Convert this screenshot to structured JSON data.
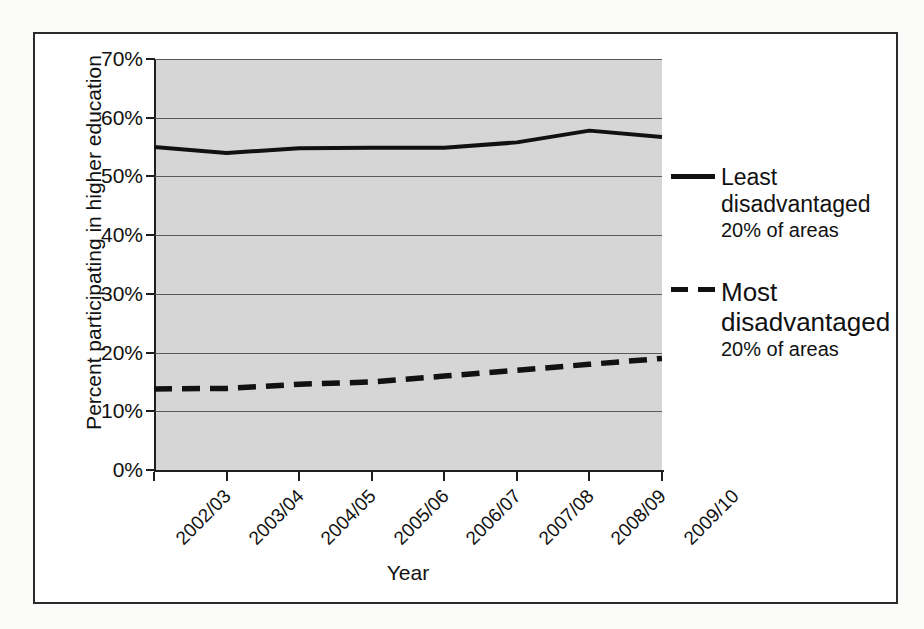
{
  "chart_data": {
    "type": "line",
    "title": "",
    "xlabel": "Year",
    "ylabel": "Percent participating in higher education",
    "categories": [
      "2002/03",
      "2003/04",
      "2004/05",
      "2005/06",
      "2006/07",
      "2007/08",
      "2008/09",
      "2009/10"
    ],
    "ylim": [
      0,
      70
    ],
    "ytick_labels": [
      "0%",
      "10%",
      "20%",
      "30%",
      "40%",
      "50%",
      "60%",
      "70%"
    ],
    "ytick_values": [
      0,
      10,
      20,
      30,
      40,
      50,
      60,
      70
    ],
    "grid": true,
    "legend_position": "right",
    "plot_background": "#d6d6d6",
    "series": [
      {
        "name": "Least disadvantaged 20% of areas",
        "style": "solid",
        "color": "#111111",
        "values": [
          55.0,
          54.0,
          54.8,
          54.9,
          54.9,
          55.8,
          57.8,
          56.7
        ]
      },
      {
        "name": "Most disadvantaged 20% of areas",
        "style": "dashed",
        "color": "#111111",
        "values": [
          13.8,
          13.9,
          14.6,
          15.0,
          16.0,
          17.0,
          18.0,
          19.0
        ]
      }
    ]
  },
  "axes": {
    "x_title": "Year",
    "y_title": "Percent participating in higher education"
  },
  "legend": {
    "entries": [
      {
        "sample": "solid",
        "line1": "Least",
        "line2": "disadvantaged",
        "line3": "20% of areas"
      },
      {
        "sample": "dashed",
        "line1": "Most",
        "line2": "disadvantaged",
        "line3": "20% of areas"
      }
    ]
  }
}
